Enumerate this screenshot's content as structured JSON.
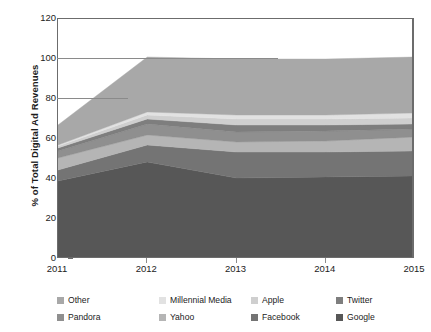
{
  "chart_data": {
    "type": "area",
    "stacked": true,
    "title": "",
    "xlabel": "",
    "ylabel": "% of Total Digital Ad Revenues",
    "categories": [
      "2011",
      "2012",
      "2013",
      "2014",
      "2015"
    ],
    "x": [
      2011,
      2012,
      2013,
      2014,
      2015
    ],
    "xlim": [
      2011,
      2015
    ],
    "ylim": [
      0,
      120
    ],
    "yticks": [
      0,
      20,
      40,
      60,
      80,
      100,
      120
    ],
    "ytick_labels": [
      "0",
      "20",
      "40",
      "60",
      "80",
      "100",
      "120"
    ],
    "grid": false,
    "legend_position": "bottom",
    "legend_columns": 4,
    "stack_order_bottom_to_top": [
      "Google",
      "Facebook",
      "Yahoo",
      "Pandora",
      "Twitter",
      "Apple",
      "Millennial Media",
      "Other"
    ],
    "series": [
      {
        "name": "Google",
        "color": "#575757",
        "values": [
          39.0,
          48.5,
          40.5,
          41.0,
          41.5
        ]
      },
      {
        "name": "Facebook",
        "color": "#747474",
        "values": [
          5.5,
          8.5,
          13.0,
          12.5,
          12.5
        ]
      },
      {
        "name": "Yahoo",
        "color": "#b5b5b5",
        "values": [
          6.0,
          5.0,
          5.0,
          5.5,
          7.0
        ]
      },
      {
        "name": "Pandora",
        "color": "#8f8f8f",
        "values": [
          3.5,
          5.5,
          5.0,
          5.0,
          4.0
        ]
      },
      {
        "name": "Twitter",
        "color": "#7e7e7e",
        "values": [
          1.5,
          2.5,
          3.5,
          3.0,
          2.5
        ]
      },
      {
        "name": "Apple",
        "color": "#cfcfcf",
        "values": [
          1.0,
          2.0,
          3.0,
          3.0,
          3.0
        ]
      },
      {
        "name": "Millennial Media",
        "color": "#e2e2e2",
        "values": [
          0.5,
          1.5,
          2.0,
          2.0,
          2.5
        ]
      },
      {
        "name": "Other",
        "color": "#a8a8a8",
        "values": [
          10.0,
          27.5,
          28.0,
          28.0,
          28.0
        ]
      }
    ],
    "cumulative_totals": [
      67.0,
      101.0,
      100.0,
      100.0,
      101.0
    ],
    "annotations": []
  },
  "legend": {
    "row1": [
      {
        "label": "Other",
        "color": "#a8a8a8"
      },
      {
        "label": "Millennial Media",
        "color": "#e2e2e2"
      },
      {
        "label": "Apple",
        "color": "#cfcfcf"
      },
      {
        "label": "Twitter",
        "color": "#7e7e7e"
      }
    ],
    "row2": [
      {
        "label": "Pandora",
        "color": "#8f8f8f"
      },
      {
        "label": "Yahoo",
        "color": "#b5b5b5"
      },
      {
        "label": "Facebook",
        "color": "#747474"
      },
      {
        "label": "Google",
        "color": "#575757"
      }
    ]
  },
  "axis": {
    "y_title": "% of Total Digital Ad Revenues",
    "y_labels": [
      "120",
      "100",
      "80",
      "60",
      "40",
      "20",
      "0"
    ],
    "x_labels": [
      "2011",
      "2012",
      "2013",
      "2014",
      "2015"
    ]
  }
}
